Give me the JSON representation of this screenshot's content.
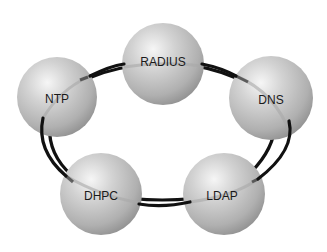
{
  "diagram": {
    "type": "ring",
    "nodes": [
      {
        "id": "radius",
        "label": "RADIUS",
        "cx": 163,
        "cy": 64,
        "r": 41
      },
      {
        "id": "dns",
        "label": "DNS",
        "cx": 271,
        "cy": 98,
        "r": 42
      },
      {
        "id": "ldap",
        "label": "LDAP",
        "cx": 224,
        "cy": 194,
        "r": 41
      },
      {
        "id": "dhpc",
        "label": "DHPC",
        "cx": 101,
        "cy": 194,
        "r": 41
      },
      {
        "id": "ntp",
        "label": "NTP",
        "cx": 57,
        "cy": 97,
        "r": 40
      }
    ],
    "edges": [
      {
        "from": "radius",
        "to": "dns"
      },
      {
        "from": "dns",
        "to": "ldap"
      },
      {
        "from": "ldap",
        "to": "dhpc"
      },
      {
        "from": "dhpc",
        "to": "ntp"
      },
      {
        "from": "ntp",
        "to": "radius"
      }
    ],
    "colors": {
      "ring": "#111111",
      "sphere_light": "#f4f4f4",
      "sphere_mid": "#bdbdbd",
      "sphere_dark": "#8a8a8a",
      "background": "#ffffff"
    }
  }
}
